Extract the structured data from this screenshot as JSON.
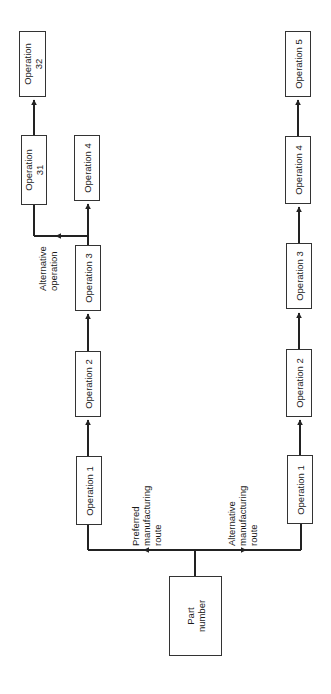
{
  "diagram": {
    "orientation": "rotated-90-ccw",
    "colors": {
      "background": "#ffffff",
      "line": "#222222",
      "box_border": "#333333",
      "text": "#1a1a1a"
    },
    "source": {
      "label_line1": "Part",
      "label_line2": "number"
    },
    "routes": {
      "preferred": {
        "label_line1": "Preferred",
        "label_line2": "manufacturing",
        "label_line3": "route",
        "operations": [
          {
            "label": "Operation 1"
          },
          {
            "label": "Operation 2"
          },
          {
            "label": "Operation 3"
          },
          {
            "label": "Operation 4"
          }
        ],
        "alternative_branch": {
          "label_line1": "Alternative",
          "label_line2": "operation",
          "operations": [
            {
              "label_line1": "Operation",
              "label_line2": "31"
            },
            {
              "label_line1": "Operation",
              "label_line2": "32"
            }
          ]
        }
      },
      "alternative": {
        "label_line1": "Alternative",
        "label_line2": "manufacturing",
        "label_line3": "route",
        "operations": [
          {
            "label": "Operation 1"
          },
          {
            "label": "Operation 2"
          },
          {
            "label": "Operation 3"
          },
          {
            "label": "Operation 4"
          },
          {
            "label": "Operation 5"
          }
        ]
      }
    }
  }
}
